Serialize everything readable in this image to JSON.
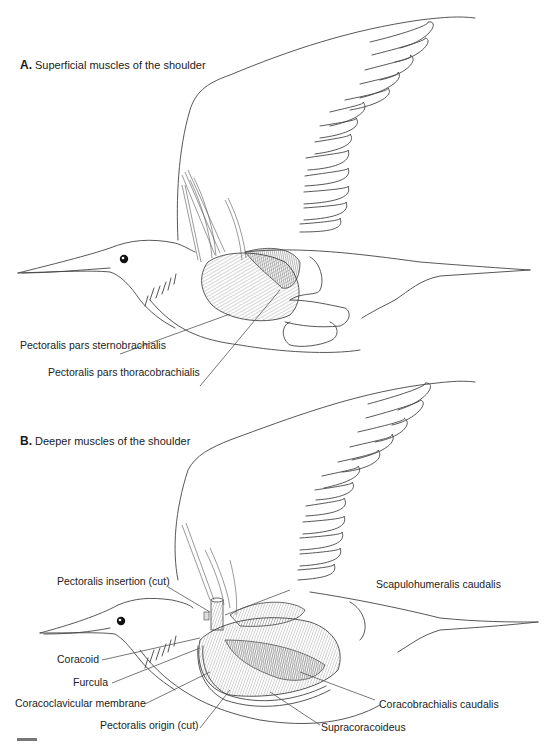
{
  "panels": [
    {
      "letter": "A.",
      "title": "Superficial muscles of the shoulder",
      "labels": [
        {
          "id": "pectoralis-pars-sternobrachialis",
          "text": "Pectoralis pars sternobrachialis"
        },
        {
          "id": "pectoralis-pars-thoracobrachialis",
          "text": "Pectoralis pars thoracobrachialis"
        }
      ]
    },
    {
      "letter": "B.",
      "title": "Deeper muscles of the shoulder",
      "labels": [
        {
          "id": "pectoralis-insertion-cut",
          "text": "Pectoralis insertion (cut)"
        },
        {
          "id": "scapulohumeralis-caudalis",
          "text": "Scapulohumeralis caudalis"
        },
        {
          "id": "coracoid",
          "text": "Coracoid"
        },
        {
          "id": "furcula",
          "text": "Furcula"
        },
        {
          "id": "coracoclavicular-membrane",
          "text": "Coracoclavicular membrane"
        },
        {
          "id": "pectoralis-origin-cut",
          "text": "Pectoralis origin (cut)"
        },
        {
          "id": "coracobrachialis-caudalis",
          "text": "Coracobrachialis caudalis"
        },
        {
          "id": "supracoracoideus",
          "text": "Supracoracoideus"
        }
      ]
    }
  ]
}
